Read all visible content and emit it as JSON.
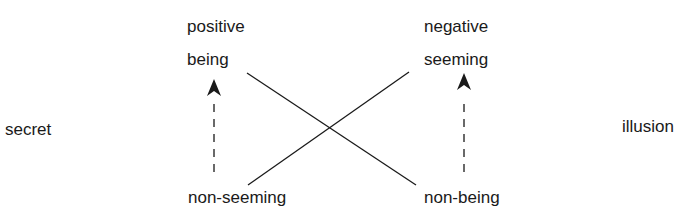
{
  "diagram": {
    "left_label": "secret",
    "right_label": "illusion",
    "left_column": {
      "header": "positive",
      "top": "being",
      "bottom": "non-seeming"
    },
    "right_column": {
      "header": "negative",
      "top": "seeming",
      "bottom": "non-being"
    },
    "connections": [
      {
        "from": "being",
        "to": "non-being",
        "style": "solid"
      },
      {
        "from": "non-seeming",
        "to": "seeming",
        "style": "solid"
      },
      {
        "from": "non-seeming",
        "to": "being",
        "style": "dashed-arrow"
      },
      {
        "from": "non-being",
        "to": "seeming",
        "style": "dashed-arrow"
      }
    ],
    "colors": {
      "line": "#1a1a1a",
      "text": "#1a1a1a",
      "background": "#ffffff"
    }
  }
}
